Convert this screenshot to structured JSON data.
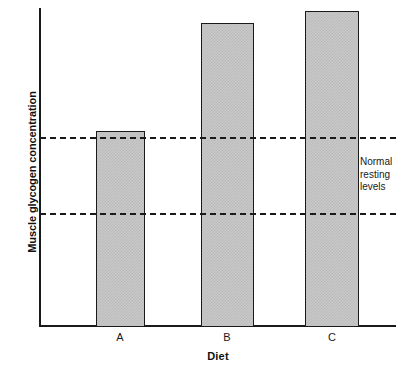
{
  "chart_data": {
    "type": "bar",
    "title": "",
    "subtitle": "",
    "xlabel": "Diet",
    "ylabel": "Muscle glycogen concentration",
    "categories": [
      "A",
      "B",
      "C"
    ],
    "values": [
      58,
      85,
      92
    ],
    "ylim": [
      0,
      100
    ],
    "xlim": [
      0,
      3
    ],
    "grid": false,
    "legend": null,
    "axis_tick_labels": {
      "x": [
        "A",
        "B",
        "C"
      ],
      "y": []
    },
    "annotations": [
      {
        "name": "normal-resting-levels",
        "lines": [
          "Normal",
          "resting",
          "levels"
        ],
        "text": "Normal resting levels",
        "x": 360,
        "y": 156
      }
    ],
    "reference_lines": [
      {
        "name": "upper-normal-resting-level",
        "value": 57,
        "style": "dashed",
        "orientation": "horizontal"
      },
      {
        "name": "lower-normal-resting-level",
        "value": 35,
        "style": "dashed",
        "orientation": "horizontal"
      }
    ],
    "bar_style": {
      "fill": "#c9c9c9",
      "pattern": "checkered-halftone",
      "edge_color": "#1a1a1a"
    },
    "axis_color": "#1a1a1a",
    "background": "#ffffff"
  },
  "bars": [
    {
      "label": "A",
      "value": 58,
      "left": 96,
      "top": 131,
      "width": 49,
      "height": 196
    },
    {
      "label": "B",
      "value": 85,
      "left": 201,
      "top": 23,
      "width": 53,
      "height": 304
    },
    {
      "label": "C",
      "value": 92,
      "left": 305,
      "top": 11,
      "width": 54,
      "height": 316
    }
  ],
  "ref_lines": [
    {
      "name": "upper",
      "top": 137
    },
    {
      "name": "lower",
      "top": 213
    }
  ],
  "cat_label_positions": [
    {
      "label": "A",
      "left": 90
    },
    {
      "label": "B",
      "left": 197
    },
    {
      "label": "C",
      "left": 302
    }
  ]
}
